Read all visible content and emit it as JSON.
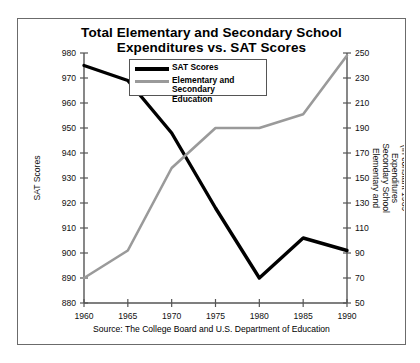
{
  "chart_data": {
    "type": "line",
    "title": "Total Elementary and Secondary School Expenditures vs. SAT Scores",
    "title_line1": "Total Elementary and Secondary School",
    "title_line2": "Expenditures vs. SAT Scores",
    "xlabel": "",
    "x": [
      1960,
      1965,
      1970,
      1975,
      1980,
      1985,
      1990
    ],
    "xtick_labels": [
      "1960",
      "1965",
      "1970",
      "1975",
      "1980",
      "1985",
      "1990"
    ],
    "xlim": [
      1960,
      1990
    ],
    "grid": false,
    "legend_position": "top-center",
    "series": [
      {
        "name": "SAT Scores",
        "axis": "left",
        "color": "#000000",
        "values": [
          975,
          969,
          948,
          918,
          890,
          906,
          901
        ]
      },
      {
        "name": "Elementary and Secondary Education",
        "axis": "right",
        "color": "#9a9a9a",
        "values": [
          70,
          92,
          158,
          190,
          190,
          201,
          248
        ]
      }
    ],
    "left_axis": {
      "label": "SAT Scores",
      "ylim": [
        880,
        980
      ],
      "ticks": [
        880,
        890,
        900,
        910,
        920,
        930,
        940,
        950,
        960,
        970,
        980
      ],
      "tick_labels": [
        "880",
        "890",
        "900",
        "910",
        "920",
        "930",
        "940",
        "950",
        "960",
        "970",
        "980"
      ]
    },
    "right_axis": {
      "label": "Elementary and Secondary School Expenditures (In constant 1989 billion dollars)",
      "label_line1": "Elementary and",
      "label_line2": "Secondary School",
      "label_line3": "Expenditures",
      "label_line4": "(In constant 1989",
      "label_line5": "billion dollars)",
      "ylim": [
        50,
        250
      ],
      "ticks": [
        50,
        70,
        90,
        110,
        130,
        150,
        170,
        190,
        210,
        230,
        250
      ],
      "tick_labels": [
        "50",
        "70",
        "90",
        "110",
        "130",
        "150",
        "170",
        "190",
        "210",
        "230",
        "250"
      ]
    },
    "annotations": {
      "source": "Source: The College Board and U.S. Department of Education"
    }
  },
  "legend": {
    "items": [
      {
        "label": "SAT Scores",
        "color": "#000000"
      },
      {
        "label": "Elementary and Secondary",
        "label2": "Education",
        "color": "#9a9a9a"
      }
    ]
  }
}
